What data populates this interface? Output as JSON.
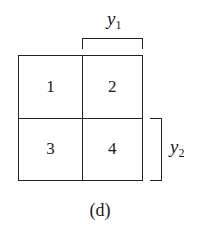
{
  "diagram": {
    "cells": [
      {
        "id": 1,
        "label": "1"
      },
      {
        "id": 2,
        "label": "2"
      },
      {
        "id": 3,
        "label": "3"
      },
      {
        "id": 4,
        "label": "4"
      }
    ],
    "brackets": {
      "top": {
        "var": "y",
        "sub": "1",
        "spans": "right column (cells 2, 4)"
      },
      "right": {
        "var": "y",
        "sub": "2",
        "spans": "bottom row (cells 3, 4)"
      }
    },
    "caption": "(d)"
  }
}
